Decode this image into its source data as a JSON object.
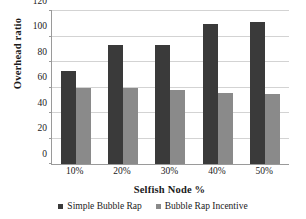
{
  "chart_data": {
    "type": "bar",
    "title": "",
    "xlabel": "Selfish Node %",
    "ylabel": "Overhead ratio",
    "categories": [
      "10%",
      "20%",
      "30%",
      "40%",
      "50%"
    ],
    "series": [
      {
        "name": "Simple Bubble Rap",
        "color": "#3a3a3a",
        "values": [
          73,
          93,
          93,
          110,
          111
        ]
      },
      {
        "name": "Bubble Rap Incentive",
        "color": "#8a8a8a",
        "values": [
          60,
          60,
          58,
          56,
          55
        ]
      }
    ],
    "ylim": [
      0,
      120
    ],
    "yticks": [
      0,
      20,
      40,
      60,
      80,
      100,
      120
    ],
    "grid": true,
    "legend_position": "bottom"
  },
  "axes": {
    "y_tick_labels": [
      "0",
      "20",
      "40",
      "60",
      "80",
      "100",
      "120"
    ],
    "x_tick_labels": [
      "10%",
      "20%",
      "30%",
      "40%",
      "50%"
    ]
  },
  "legend": {
    "entries": [
      {
        "label": "Simple Bubble Rap",
        "marker": "square-marker-dark"
      },
      {
        "label": "Bubble Rap Incentive",
        "marker": "square-marker-gray"
      }
    ]
  }
}
